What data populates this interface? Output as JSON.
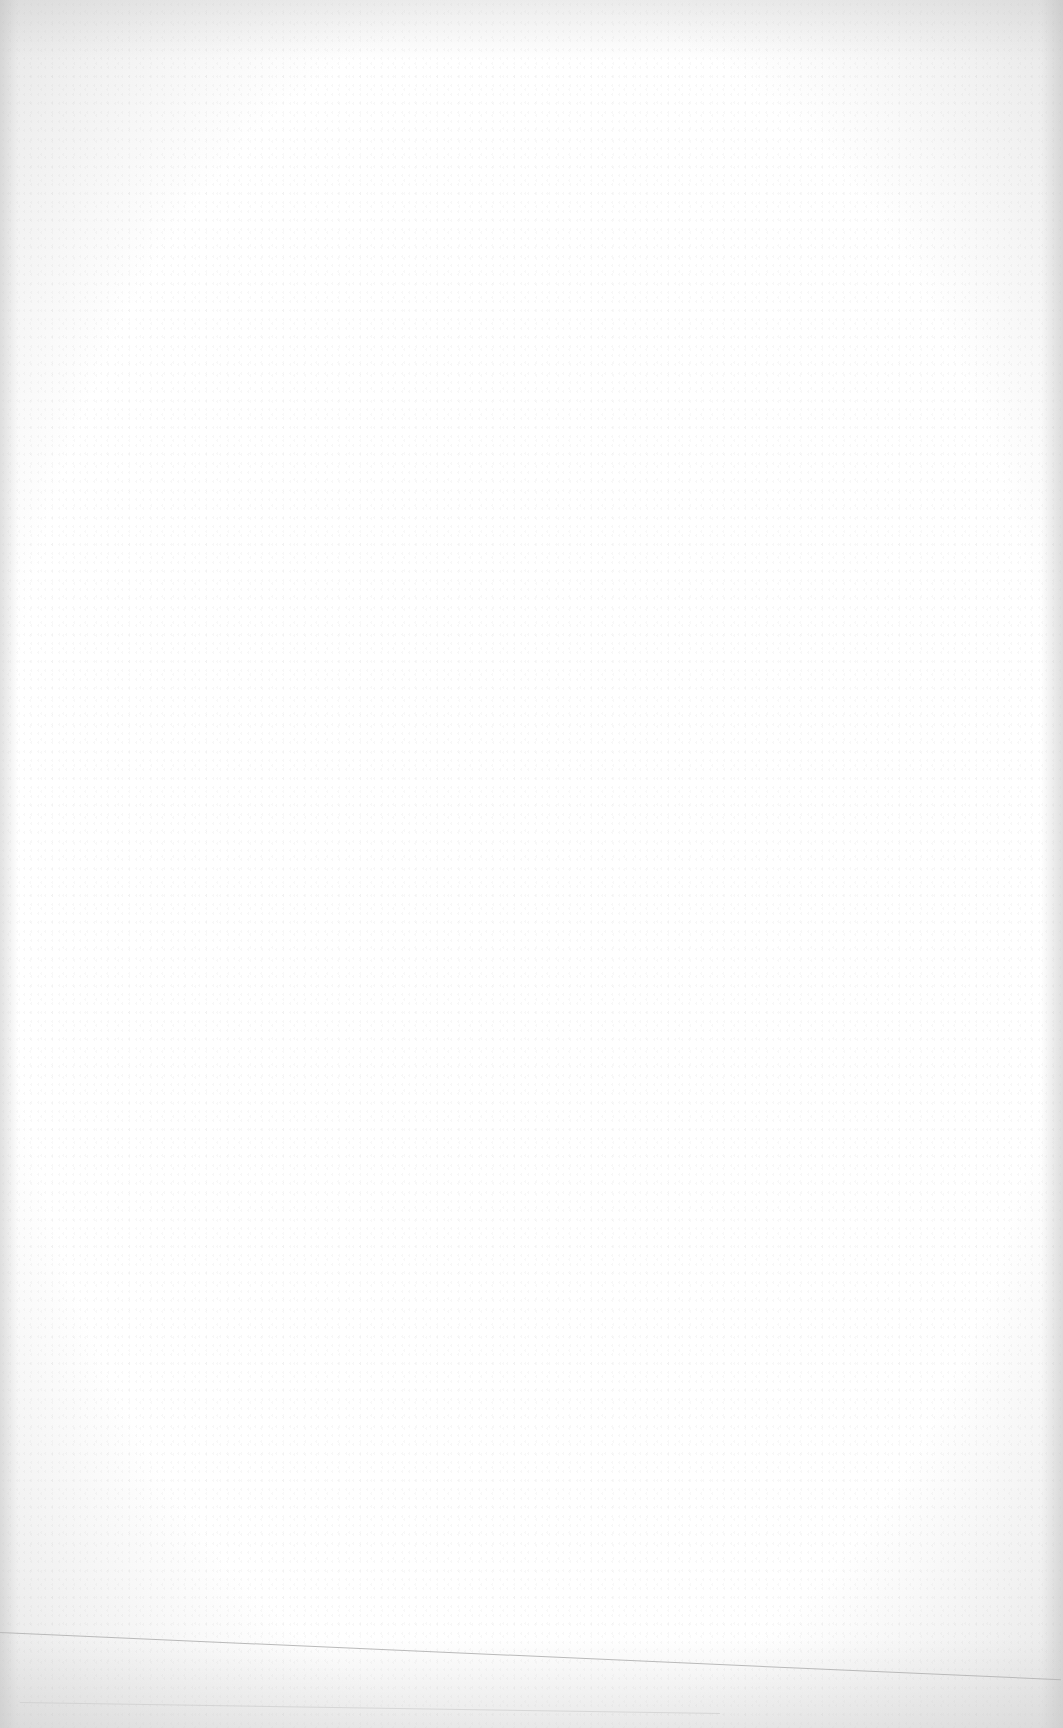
{
  "page": {
    "type": "blank-scanned-page",
    "text_content": "",
    "background_color": "#ffffff",
    "fold_line_color": "#b9b9b9"
  }
}
